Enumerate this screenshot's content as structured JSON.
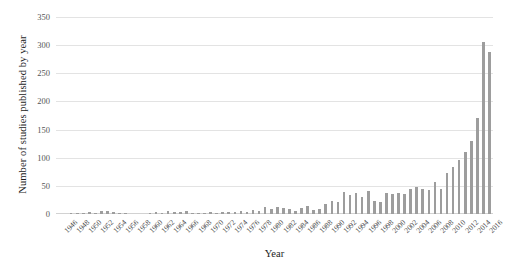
{
  "chart_data": {
    "type": "bar",
    "title": "",
    "xlabel": "Year",
    "ylabel": "Number of studies published by year",
    "ylim": [
      0,
      350
    ],
    "ytick_values": [
      0,
      50,
      100,
      150,
      200,
      250,
      300,
      350
    ],
    "ytick_labels": [
      "0",
      "50",
      "100",
      "150",
      "200",
      "250",
      "300",
      "350"
    ],
    "grid": true,
    "legend": false,
    "bar_color": "#9d9d9d",
    "gridline_color": "#e3e3e3",
    "xtick_step": 2,
    "xtick_labels": [
      "1946",
      "1948",
      "1950",
      "1952",
      "1954",
      "1956",
      "1958",
      "1960",
      "1962",
      "1964",
      "1966",
      "1968",
      "1970",
      "1972",
      "1974",
      "1976",
      "1978",
      "1980",
      "1982",
      "1984",
      "1986",
      "1988",
      "1990",
      "1992",
      "1994",
      "1996",
      "1998",
      "2000",
      "2002",
      "2004",
      "2006",
      "2008",
      "2010",
      "2012",
      "2014",
      "2016"
    ],
    "categories": [
      "1946",
      "1947",
      "1948",
      "1949",
      "1950",
      "1951",
      "1952",
      "1953",
      "1954",
      "1955",
      "1956",
      "1957",
      "1958",
      "1959",
      "1960",
      "1961",
      "1962",
      "1963",
      "1964",
      "1965",
      "1966",
      "1967",
      "1968",
      "1969",
      "1970",
      "1971",
      "1972",
      "1973",
      "1974",
      "1975",
      "1976",
      "1977",
      "1978",
      "1979",
      "1980",
      "1981",
      "1982",
      "1983",
      "1984",
      "1985",
      "1986",
      "1987",
      "1988",
      "1989",
      "1990",
      "1991",
      "1992",
      "1993",
      "1994",
      "1995",
      "1996",
      "1997",
      "1998",
      "1999",
      "2000",
      "2001",
      "2002",
      "2003",
      "2004",
      "2005",
      "2006",
      "2007",
      "2008",
      "2009",
      "2010",
      "2011",
      "2012",
      "2013",
      "2014",
      "2015",
      "2016",
      "2017"
    ],
    "values": [
      0,
      0,
      1,
      1,
      1,
      4,
      1,
      6,
      5,
      3,
      2,
      1,
      0,
      0,
      0,
      1,
      3,
      2,
      5,
      3,
      4,
      6,
      2,
      2,
      1,
      3,
      2,
      3,
      3,
      4,
      5,
      4,
      7,
      5,
      12,
      9,
      13,
      11,
      9,
      6,
      11,
      14,
      7,
      9,
      17,
      24,
      21,
      39,
      33,
      37,
      30,
      41,
      24,
      22,
      37,
      36,
      37,
      36,
      45,
      48,
      44,
      42,
      57,
      45,
      72,
      83,
      96,
      111,
      129,
      170,
      305,
      287
    ]
  }
}
